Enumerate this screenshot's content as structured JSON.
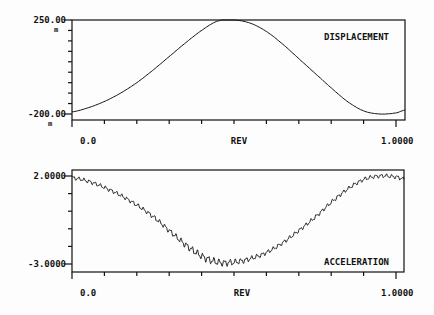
{
  "chart_data": [
    {
      "type": "line",
      "title": "DISPLACEMENT",
      "xlabel": "REV",
      "ylabel": "",
      "x_tick_labels": [
        "0.0",
        "1.0000"
      ],
      "y_tick_labels": [
        "250.00",
        "-200.00"
      ],
      "y_unit_marks": [
        "m",
        "m"
      ],
      "xlim": [
        0.0,
        1.0
      ],
      "ylim": [
        -200.0,
        250.0
      ],
      "grid": false,
      "x_minor_ticks": 10,
      "y_minor_ticks": 9,
      "x": [
        0.0,
        0.05,
        0.1,
        0.15,
        0.2,
        0.25,
        0.3,
        0.35,
        0.4,
        0.45,
        0.5,
        0.55,
        0.6,
        0.65,
        0.7,
        0.75,
        0.8,
        0.85,
        0.9,
        0.95,
        1.0,
        1.03
      ],
      "values": [
        -190,
        -170,
        -140,
        -100,
        -50,
        10,
        75,
        140,
        200,
        245,
        250,
        235,
        195,
        135,
        65,
        -5,
        -75,
        -140,
        -185,
        -200,
        -195,
        -180
      ]
    },
    {
      "type": "line",
      "title": "ACCELERATION",
      "xlabel": "REV",
      "ylabel": "",
      "x_tick_labels": [
        "0.0",
        "1.0000"
      ],
      "y_tick_labels": [
        "2.0000",
        "-3.0000"
      ],
      "xlim": [
        0.0,
        1.0
      ],
      "ylim": [
        -3.0,
        2.0
      ],
      "grid": false,
      "x_minor_ticks": 10,
      "y_minor_ticks": 5,
      "ripple_amplitude": 0.12,
      "x": [
        0.0,
        0.05,
        0.1,
        0.15,
        0.2,
        0.25,
        0.3,
        0.35,
        0.4,
        0.45,
        0.5,
        0.55,
        0.6,
        0.65,
        0.7,
        0.75,
        0.8,
        0.85,
        0.9,
        0.95,
        1.0,
        1.03
      ],
      "values": [
        1.9,
        1.7,
        1.35,
        0.9,
        0.35,
        -0.3,
        -1.1,
        -1.9,
        -2.55,
        -2.9,
        -2.9,
        -2.7,
        -2.35,
        -1.8,
        -1.1,
        -0.35,
        0.5,
        1.25,
        1.8,
        2.0,
        1.95,
        1.8
      ]
    }
  ],
  "plots": {
    "top": {
      "title": "DISPLACEMENT",
      "y_max_label": "250.00",
      "y_min_label": "-200.00",
      "unit_mark": "m",
      "x_start_label": "0.0",
      "x_mid_label": "REV",
      "x_end_label": "1.0000"
    },
    "bottom": {
      "title": "ACCELERATION",
      "y_max_label": "2.0000",
      "y_min_label": "-3.0000",
      "x_start_label": "0.0",
      "x_mid_label": "REV",
      "x_end_label": "1.0000"
    }
  },
  "colors": {
    "ink": "#111111",
    "paper": "#fdfdfd"
  }
}
